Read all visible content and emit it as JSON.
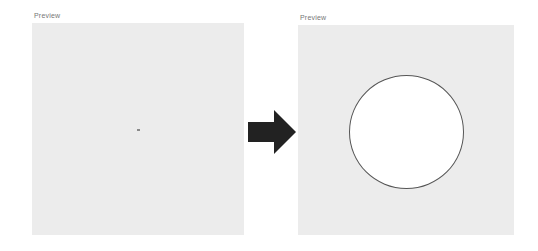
{
  "left_panel": {
    "label": "Preview",
    "state": "before"
  },
  "right_panel": {
    "label": "Preview",
    "state": "after",
    "shape": "circle"
  },
  "arrow": {
    "icon": "right-arrow-icon",
    "color": "#222222"
  },
  "colors": {
    "panel_bg": "#ececec",
    "circle_fill": "#ffffff",
    "circle_stroke": "#555555"
  }
}
